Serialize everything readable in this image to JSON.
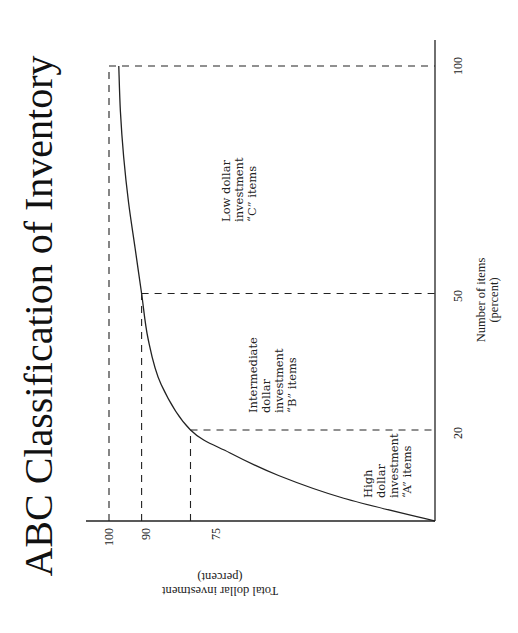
{
  "chart_data": {
    "type": "line",
    "title": "ABC Classification of Inventory",
    "orientation_note": "figure rotated 90 degrees counter-clockwise",
    "xlabel": "Number of items (percent)",
    "xlabel_lines": [
      "Number of items",
      "(percent)"
    ],
    "ylabel": "Total dollar investment (percent)",
    "ylabel_lines": [
      "Total dollar investment",
      "(percent)"
    ],
    "xlim": [
      0,
      100
    ],
    "ylim": [
      0,
      100
    ],
    "x_ticks": [
      20,
      50,
      100
    ],
    "y_ticks": [
      75,
      90,
      100
    ],
    "grid": false,
    "legend": null,
    "series": [
      {
        "name": "Cumulative dollar investment",
        "x": [
          0,
          5,
          10,
          15,
          20,
          30,
          40,
          50,
          60,
          70,
          80,
          90,
          100
        ],
        "y": [
          0,
          28,
          48,
          63,
          75,
          84,
          88,
          90,
          92,
          94,
          95.5,
          96.5,
          97
        ]
      }
    ],
    "reference_lines": [
      {
        "x": 20,
        "y": 75
      },
      {
        "x": 50,
        "y": 90
      },
      {
        "x": 100,
        "y": 100
      }
    ],
    "annotations": [
      {
        "label": "High dollar investment \"A\" items",
        "lines": [
          "High",
          "dollar",
          "investment",
          "“A” items"
        ],
        "x_center": 10,
        "y_pos": 35
      },
      {
        "label": "Intermediate dollar investment \"B\" items",
        "lines": [
          "Intermediate",
          "dollar",
          "investment",
          "“B” items"
        ],
        "x_center": 35,
        "y_pos": 60
      },
      {
        "label": "Low dollar investment \"C\" items",
        "lines": [
          "Low dollar",
          "investment",
          "“C” items"
        ],
        "x_center": 75,
        "y_pos": 67
      }
    ]
  },
  "labels": {
    "title": "ABC Classification of Inventory",
    "x_tick_20": "20",
    "x_tick_50": "50",
    "x_tick_100": "100",
    "y_tick_75": "75",
    "y_tick_90": "90",
    "y_tick_100": "100",
    "xlabel_line1": "Number of items",
    "xlabel_line2": "(percent)",
    "ylabel_line1": "Total dollar investment",
    "ylabel_line2": "(percent)",
    "a_line1": "High",
    "a_line2": "dollar",
    "a_line3": "investment",
    "a_line4": "“A” items",
    "b_line1": "Intermediate",
    "b_line2": "dollar",
    "b_line3": "investment",
    "b_line4": "“B” items",
    "c_line1": "Low dollar",
    "c_line2": "investment",
    "c_line3": "“C” items"
  }
}
